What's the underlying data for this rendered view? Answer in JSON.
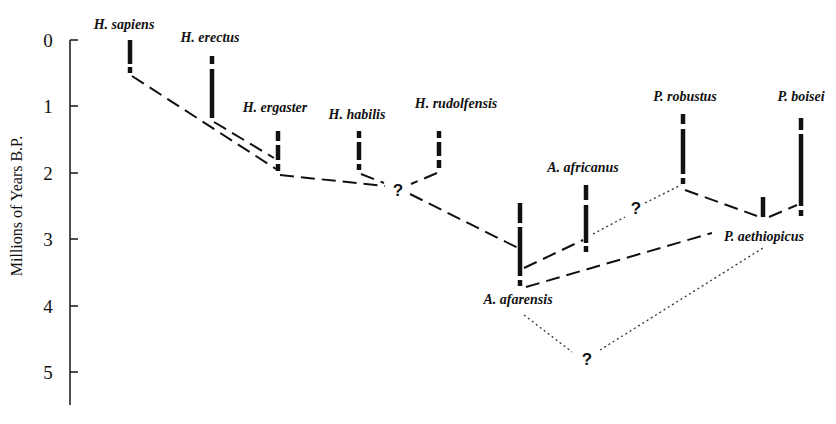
{
  "figure": {
    "type": "phylogenetic-tree",
    "axis": {
      "title": "Millions of Years B.P.",
      "ticks": [
        "0",
        "1",
        "2",
        "3",
        "4",
        "5"
      ]
    },
    "taxa": [
      {
        "label": "H. sapiens",
        "range_mya": [
          0.0,
          0.5
        ]
      },
      {
        "label": "H. erectus",
        "range_mya": [
          0.25,
          1.25
        ]
      },
      {
        "label": "H. ergaster",
        "range_mya": [
          1.4,
          1.95
        ]
      },
      {
        "label": "H. habilis",
        "range_mya": [
          1.4,
          1.95
        ]
      },
      {
        "label": "H. rudolfensis",
        "range_mya": [
          1.4,
          1.95
        ]
      },
      {
        "label": "A. afarensis",
        "range_mya": [
          2.45,
          3.65
        ]
      },
      {
        "label": "A. africanus",
        "range_mya": [
          2.2,
          3.15
        ]
      },
      {
        "label": "P. robustus",
        "range_mya": [
          1.1,
          2.1
        ]
      },
      {
        "label": "P. aethiopicus",
        "range_mya": [
          2.4,
          2.7
        ]
      },
      {
        "label": "P. boisei",
        "range_mya": [
          1.2,
          2.6
        ]
      }
    ],
    "uncertain_nodes": [
      {
        "label": "?",
        "position": "Homo common ancestor, ~2.3 Mya"
      },
      {
        "label": "?",
        "position": "A. africanus to P. robustus link, ~2.5 Mya"
      },
      {
        "label": "?",
        "position": "A. afarensis to P. aethiopicus link, ~4.8 Mya"
      }
    ],
    "labels": {
      "sapiens": "H. sapiens",
      "erectus": "H. erectus",
      "ergaster": "H. ergaster",
      "habilis": "H. habilis",
      "rudolfensis": "H. rudolfensis",
      "africanus": "A. africanus",
      "afarensis": "A. afarensis",
      "robustus": "P. robustus",
      "boisei": "P. boisei",
      "aethiopicus": "P. aethiopicus",
      "q1": "?",
      "q2": "?",
      "q3": "?"
    }
  }
}
